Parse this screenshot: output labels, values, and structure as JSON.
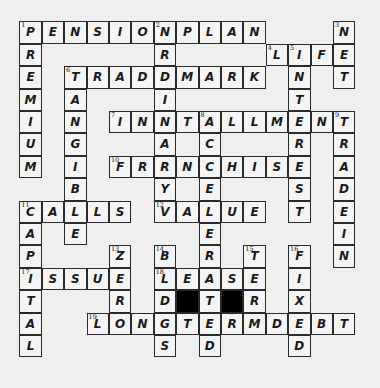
{
  "puzzle": {
    "rows": 15,
    "cols": 15,
    "entries": [
      {
        "number": "1",
        "direction": "across",
        "answer": "PENSIONPLAN",
        "row": 0,
        "col": 0
      },
      {
        "number": "1",
        "direction": "down",
        "answer": "PREMIUM",
        "row": 0,
        "col": 0
      },
      {
        "number": "2",
        "direction": "down",
        "answer": "ORDINARY",
        "row": 0,
        "col": 6
      },
      {
        "number": "3",
        "direction": "down",
        "answer": "NET",
        "row": 0,
        "col": 14
      },
      {
        "number": "4",
        "direction": "across",
        "answer": "LIFE",
        "row": 1,
        "col": 11
      },
      {
        "number": "5",
        "direction": "down",
        "answer": "INTEREST",
        "row": 1,
        "col": 12
      },
      {
        "number": "6",
        "direction": "across",
        "answer": "TRADEMARK",
        "row": 2,
        "col": 2
      },
      {
        "number": "6",
        "direction": "down",
        "answer": "TANGIBLE",
        "row": 2,
        "col": 2
      },
      {
        "number": "7",
        "direction": "across",
        "answer": "INSTALLMENT",
        "row": 4,
        "col": 4
      },
      {
        "number": "8",
        "direction": "down",
        "answer": "ACCELERATED",
        "row": 4,
        "col": 8
      },
      {
        "number": "9",
        "direction": "down",
        "answer": "TRADEIN",
        "row": 4,
        "col": 14
      },
      {
        "number": "10",
        "direction": "across",
        "answer": "FRANCHISE",
        "row": 6,
        "col": 4
      },
      {
        "number": "11",
        "direction": "across",
        "answer": "CALLS",
        "row": 8,
        "col": 0
      },
      {
        "number": "11",
        "direction": "down",
        "answer": "CAPITAL",
        "row": 8,
        "col": 0
      },
      {
        "number": "12",
        "direction": "across",
        "answer": "VALUE",
        "row": 8,
        "col": 6
      },
      {
        "number": "13",
        "direction": "down",
        "answer": "ZERO",
        "row": 10,
        "col": 4
      },
      {
        "number": "14",
        "direction": "down",
        "answer": "BLDGS",
        "row": 10,
        "col": 6
      },
      {
        "number": "15",
        "direction": "down",
        "answer": "TERM",
        "row": 10,
        "col": 10
      },
      {
        "number": "16",
        "direction": "down",
        "answer": "FIXED",
        "row": 10,
        "col": 12
      },
      {
        "number": "17",
        "direction": "across",
        "answer": "ISSUE",
        "row": 11,
        "col": 0
      },
      {
        "number": "18",
        "direction": "across",
        "answer": "LEASE",
        "row": 11,
        "col": 6
      },
      {
        "number": "19",
        "direction": "across",
        "answer": "LONGTERMDEBT",
        "row": 13,
        "col": 3
      }
    ],
    "black_cells": [
      [
        12,
        7
      ],
      [
        12,
        9
      ]
    ]
  }
}
